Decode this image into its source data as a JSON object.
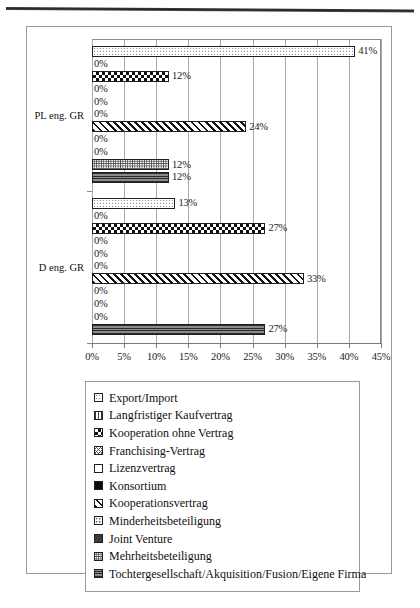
{
  "chart_data": {
    "type": "bar",
    "orientation": "horizontal",
    "title": "",
    "xlabel": "",
    "ylabel": "",
    "xlim": [
      0,
      45
    ],
    "xtick_labels": [
      "0%",
      "5%",
      "10%",
      "15%",
      "20%",
      "25%",
      "30%",
      "35%",
      "40%",
      "45%"
    ],
    "xtick_values": [
      0,
      5,
      10,
      15,
      20,
      25,
      30,
      35,
      40,
      45
    ],
    "grid": true,
    "legend_position": "bottom",
    "categories": [
      "PL eng. GR",
      "D eng. GR"
    ],
    "series": [
      {
        "name": "Export/Import",
        "pattern": "dots-light",
        "values": [
          41,
          13
        ],
        "labels": [
          "41%",
          "13%"
        ]
      },
      {
        "name": "Langfristiger Kaufvertrag",
        "pattern": "vert-bars",
        "values": [
          0,
          0
        ],
        "labels": [
          "0%",
          "0%"
        ]
      },
      {
        "name": "Kooperation ohne Vertrag",
        "pattern": "checker",
        "values": [
          12,
          27
        ],
        "labels": [
          "12%",
          "27%"
        ]
      },
      {
        "name": "Franchising-Vertrag",
        "pattern": "crosshatch-fine",
        "values": [
          0,
          0
        ],
        "labels": [
          "0%",
          "0%"
        ]
      },
      {
        "name": "Lizenzvertrag",
        "pattern": "dots-sparse",
        "values": [
          0,
          0
        ],
        "labels": [
          "0%",
          "0%"
        ]
      },
      {
        "name": "Konsortium",
        "pattern": "solid-black",
        "values": [
          0,
          0
        ],
        "labels": [
          "0%",
          "0%"
        ]
      },
      {
        "name": "Kooperationsvertrag",
        "pattern": "diag-hatch",
        "values": [
          24,
          33
        ],
        "labels": [
          "24%",
          "33%"
        ]
      },
      {
        "name": "Minderheitsbeteiligung",
        "pattern": "dots-grid",
        "values": [
          0,
          0
        ],
        "labels": [
          "0%",
          "0%"
        ]
      },
      {
        "name": "Joint Venture",
        "pattern": "dark-gray",
        "values": [
          0,
          0
        ],
        "labels": [
          "0%",
          "0%"
        ]
      },
      {
        "name": "Mehrheitsbeteiligung",
        "pattern": "dots-dense",
        "values": [
          12,
          0
        ],
        "labels": [
          "12%",
          "0%"
        ]
      },
      {
        "name": "Tochtergesellschaft/Akquisition/Fusion/Eigene Firma",
        "pattern": "horiz-lines",
        "values": [
          12,
          27
        ],
        "labels": [
          "12%",
          "27%"
        ]
      }
    ]
  },
  "legend": {
    "items": [
      "Export/Import",
      "Langfristiger Kaufvertrag",
      "Kooperation ohne Vertrag",
      "Franchising-Vertrag",
      "Lizenzvertrag",
      "Konsortium",
      "Kooperationsvertrag",
      "Minderheitsbeteiligung",
      "Joint Venture",
      "Mehrheitsbeteiligung",
      "Tochtergesellschaft/Akquisition/Fusion/Eigene Firma"
    ]
  }
}
